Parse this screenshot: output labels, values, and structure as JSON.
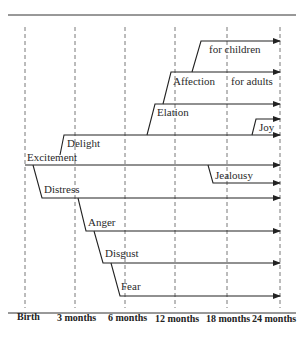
{
  "diagram": {
    "type": "emotional-development-timeline",
    "axis_labels": [
      "Birth",
      "3 months",
      "6 months",
      "12 months",
      "18 months",
      "24 months"
    ],
    "emotions": {
      "excitement": "Excitement",
      "delight": "Delight",
      "distress": "Distress",
      "elation": "Elation",
      "affection": "Affection",
      "for_children": "for children",
      "for_adults": "for adults",
      "joy": "Joy",
      "jealousy": "Jealousy",
      "anger": "Anger",
      "disgust": "Disgust",
      "fear": "Fear"
    },
    "branches": [
      {
        "name": "Excitement",
        "from": "Birth",
        "to": "24 months"
      },
      {
        "name": "Delight",
        "branches_from": "Excitement",
        "at": "~3 months"
      },
      {
        "name": "Distress",
        "branches_from": "Excitement",
        "at": "~1 month"
      },
      {
        "name": "Elation",
        "branches_from": "Delight",
        "at": "~12 months"
      },
      {
        "name": "Affection (for adults)",
        "branches_from": "Elation",
        "at": "~12 months"
      },
      {
        "name": "Affection for children",
        "branches_from": "Affection",
        "at": "~15 months"
      },
      {
        "name": "Joy",
        "branches_from": "Delight",
        "at": "~22 months"
      },
      {
        "name": "Jealousy",
        "branches_from": "Excitement",
        "at": "~17 months"
      },
      {
        "name": "Anger",
        "branches_from": "Distress",
        "at": "~4 months"
      },
      {
        "name": "Disgust",
        "branches_from": "Anger",
        "at": "~5 months"
      },
      {
        "name": "Fear",
        "branches_from": "Disgust",
        "at": "~6 months"
      }
    ]
  }
}
